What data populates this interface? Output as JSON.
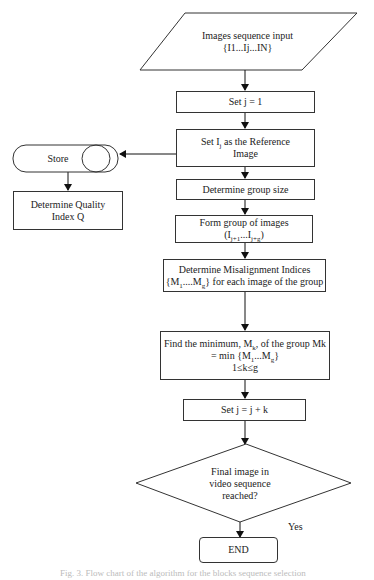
{
  "flowchart": {
    "input": {
      "line1": "Images sequence input",
      "line2": "{I1...Ij...IN}"
    },
    "set_j": "Set j = 1",
    "set_ref": {
      "line1_pre": "Set I",
      "line1_sub": "j",
      "line1_post": " as the Reference",
      "line2": "Image"
    },
    "group_size": "Determine group size",
    "form_group": {
      "line1": "Form group of images",
      "line2_pre": "(I",
      "line2_sub1": "j+1",
      "line2_mid": "...I",
      "line2_sub2": "j+g",
      "line2_post": ")"
    },
    "misalign": {
      "line1": "Determine Misalignment Indices",
      "line2_pre": "{M",
      "line2_sub1": "1",
      "line2_mid": "....M",
      "line2_sub2": "g",
      "line2_post": "} for each image of the group"
    },
    "find_min": {
      "line1_pre": "Find the minimum, M",
      "line1_sub": "k",
      "line1_post": ", of the group Mk",
      "line2_pre": "= min {M",
      "line2_sub1": "1",
      "line2_mid": "...M",
      "line2_sub2": "g",
      "line2_post": "}",
      "line3": "1≤k≤g"
    },
    "set_jk": "Set j = j + k",
    "decision": {
      "line1": "Final image in",
      "line2": "video sequence",
      "line3": "reached?"
    },
    "yes_label": "Yes",
    "end": "END",
    "store": "Store",
    "quality": {
      "line1": "Determine Quality",
      "line2": "Index Q"
    }
  },
  "caption": "Fig. 3. Flow chart of the algorithm for the blocks sequence selection"
}
